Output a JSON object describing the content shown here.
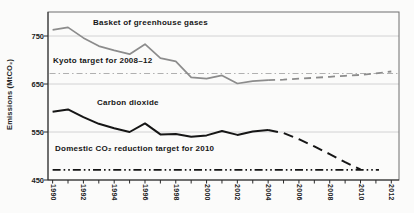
{
  "chart_data": {
    "type": "line",
    "ylabel": "Emissions (MtCO₂)",
    "xlabel": "",
    "grid": "horizontal-only",
    "legend_position": "inline-labels",
    "x_axis": {
      "min": 1989.7,
      "max": 2012.5,
      "tick_years": [
        1990,
        1992,
        1994,
        1996,
        1998,
        2000,
        2002,
        2004,
        2006,
        2008,
        2010,
        2012
      ],
      "tick_labels": [
        "1990",
        "1992",
        "1994",
        "1996",
        "1998",
        "2000",
        "2002",
        "2004",
        "2006",
        "2008",
        "2010",
        "2012"
      ],
      "minor_tick_start": 1990,
      "minor_tick_end": 2012,
      "minor_tick_step": 1
    },
    "y_axis": {
      "min": 450,
      "max": 800,
      "ticks": [
        450,
        550,
        650,
        750
      ],
      "tick_labels": [
        "450",
        "550",
        "650",
        "750"
      ],
      "gridlines": [
        550,
        650,
        750
      ]
    },
    "series": [
      {
        "name": "basket-of-greenhouse-gases",
        "label": "Basket of greenhouse gases",
        "color": "#8c8c8c",
        "style": "solid",
        "width": 1.7,
        "x": [
          1990,
          1991,
          1992,
          1993,
          1994,
          1995,
          1996,
          1997,
          1998,
          1999,
          2000,
          2001,
          2002,
          2003,
          2004
        ],
        "values": [
          763,
          768,
          746,
          729,
          720,
          712,
          733,
          704,
          697,
          664,
          661,
          668,
          651,
          656,
          658
        ]
      },
      {
        "name": "basket-projection",
        "label": "",
        "color": "#8c8c8c",
        "style": "dashed",
        "width": 1.8,
        "dash": "7 5",
        "x": [
          2004,
          2005,
          2006,
          2007,
          2008,
          2009,
          2010,
          2011,
          2012
        ],
        "values": [
          658,
          659,
          661,
          663,
          665,
          667,
          669,
          672,
          676
        ]
      },
      {
        "name": "carbon-dioxide",
        "label": "Carbon dioxide",
        "color": "#161616",
        "style": "solid",
        "width": 2,
        "x": [
          1990,
          1991,
          1992,
          1993,
          1994,
          1995,
          1996,
          1997,
          1998,
          1999,
          2000,
          2001,
          2002,
          2003,
          2004
        ],
        "values": [
          592,
          597,
          581,
          567,
          558,
          550,
          568,
          545,
          546,
          540,
          543,
          552,
          544,
          551,
          554
        ]
      },
      {
        "name": "carbon-dioxide-projection",
        "label": "",
        "color": "#161616",
        "style": "dashed",
        "width": 2,
        "dash": "10 6",
        "x": [
          2004,
          2005,
          2006,
          2007,
          2008,
          2009,
          2010
        ],
        "values": [
          554,
          548,
          535,
          520,
          504,
          487,
          472
        ]
      }
    ],
    "reference_lines": [
      {
        "name": "kyoto-target",
        "label": "Kyoto target for 2008–12",
        "value": 672,
        "x_start": 1989.8,
        "x_end": 2012.4,
        "color": "#b0b0b0",
        "style": "dash-dot",
        "width": 1.1
      },
      {
        "name": "domestic-target",
        "label": "Domestic CO₂ reduction target for 2010",
        "value": 471,
        "x_start": 1990,
        "x_end": 2011.2,
        "color": "#161616",
        "style": "dash-dot-dot",
        "width": 1.8
      }
    ],
    "colors": {
      "background": "#fbfbfa",
      "frame": "#6e6e6e",
      "axis": "#2a2a2a",
      "gridline": "#c9c9c9"
    }
  }
}
